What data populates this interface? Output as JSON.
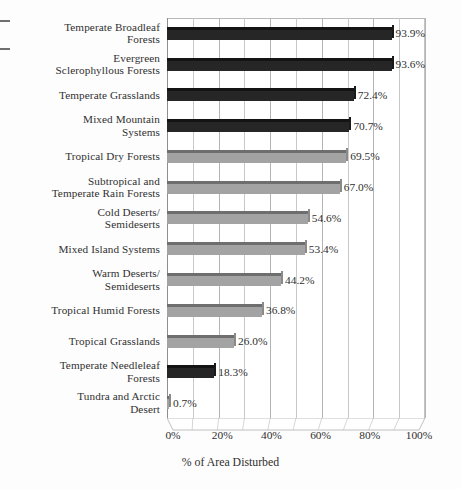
{
  "chart_data": {
    "type": "bar",
    "orientation": "horizontal",
    "title": "",
    "xlabel": "% of Area Disturbed",
    "ylabel": "",
    "xlim": [
      0,
      100
    ],
    "xticks": [
      "0%",
      "20%",
      "40%",
      "60%",
      "80%",
      "100%"
    ],
    "xtick_values": [
      0,
      20,
      40,
      60,
      80,
      100
    ],
    "minor_gridline_step": 10,
    "grid": true,
    "legend": "none",
    "categories": [
      "Temperate Broadleaf Forests",
      "Evergreen Sclerophyllous Forests",
      "Temperate Grasslands",
      "Mixed Mountain Systems",
      "Tropical Dry Forests",
      "Subtropical and Temperate Rain Forests",
      "Cold Deserts/ Semideserts",
      "Mixed Island Systems",
      "Warm Deserts/ Semideserts",
      "Tropical Humid Forests",
      "Tropical Grasslands",
      "Temperate Needleleaf Forests",
      "Tundra and Arctic Desert"
    ],
    "values": [
      93.9,
      93.6,
      72.4,
      70.7,
      69.5,
      67.0,
      54.6,
      53.4,
      44.2,
      36.8,
      26.0,
      18.3,
      0.7
    ],
    "data_labels": [
      "93.9%",
      "93.6%",
      "72.4%",
      "70.7%",
      "69.5%",
      "67.0%",
      "54.6%",
      "53.4%",
      "44.2%",
      "36.8%",
      "26.0%",
      "18.3%",
      "0.7%"
    ],
    "bar_shades": [
      "dark",
      "dark",
      "dark",
      "dark",
      "light",
      "light",
      "light",
      "light",
      "light",
      "light",
      "light",
      "dark",
      "light"
    ],
    "colors": {
      "dark_bar": "#262626",
      "light_bar": "#a3a3a3",
      "gridline": "#c9c9c9",
      "axis": "#8e8e8e",
      "text": "#2f2f2f",
      "background": "#ffffff"
    }
  },
  "rows": [
    {
      "label_line1": "Temperate Broadleaf",
      "label_line2": "Forests",
      "value_label": "93.9%"
    },
    {
      "label_line1": "Evergreen",
      "label_line2": "Sclerophyllous Forests",
      "value_label": "93.6%"
    },
    {
      "label_line1": "Temperate Grasslands",
      "label_line2": "",
      "value_label": "72.4%"
    },
    {
      "label_line1": "Mixed Mountain",
      "label_line2": "Systems",
      "value_label": "70.7%"
    },
    {
      "label_line1": "Tropical Dry Forests",
      "label_line2": "",
      "value_label": "69.5%"
    },
    {
      "label_line1": "Subtropical and",
      "label_line2": "Temperate Rain Forests",
      "value_label": "67.0%"
    },
    {
      "label_line1": "Cold Deserts/",
      "label_line2": "Semideserts",
      "value_label": "54.6%"
    },
    {
      "label_line1": "Mixed Island Systems",
      "label_line2": "",
      "value_label": "53.4%"
    },
    {
      "label_line1": "Warm Deserts/",
      "label_line2": "Semideserts",
      "value_label": "44.2%"
    },
    {
      "label_line1": "Tropical Humid Forests",
      "label_line2": "",
      "value_label": "36.8%"
    },
    {
      "label_line1": "Tropical Grasslands",
      "label_line2": "",
      "value_label": "26.0%"
    },
    {
      "label_line1": "Temperate Needleleaf",
      "label_line2": "Forests",
      "value_label": "18.3%"
    },
    {
      "label_line1": "Tundra and Arctic",
      "label_line2": "Desert",
      "value_label": "0.7%"
    }
  ],
  "axis": {
    "ticks": [
      "0%",
      "20%",
      "40%",
      "60%",
      "80%",
      "100%"
    ],
    "title": "% of Area Disturbed"
  }
}
